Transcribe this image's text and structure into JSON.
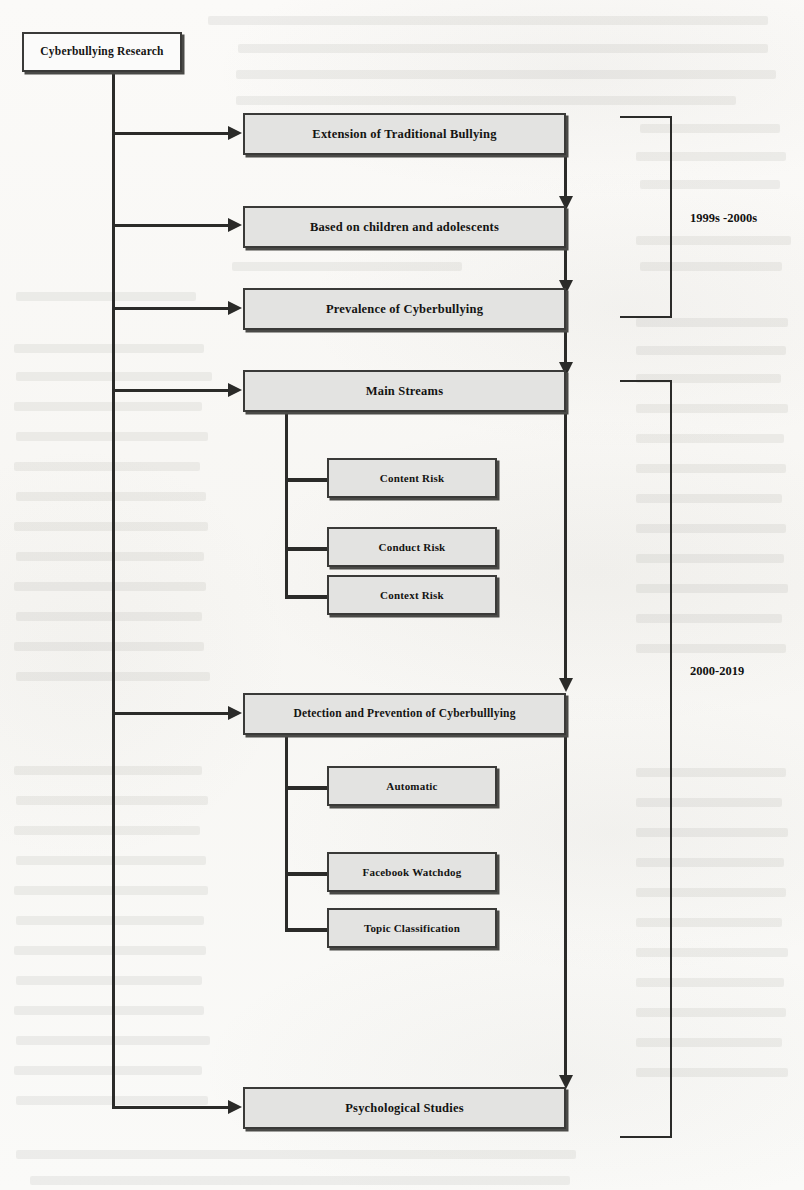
{
  "diagram": {
    "title_node": {
      "label": "Cyberbullying Research"
    },
    "nodes": [
      {
        "id": "extension",
        "label": "Extension of Traditional Bullying"
      },
      {
        "id": "based",
        "label": "Based on children and adolescents"
      },
      {
        "id": "prevalence",
        "label": "Prevalence of Cyberbullying"
      },
      {
        "id": "mainstreams",
        "label": "Main Streams"
      },
      {
        "id": "content",
        "label": "Content Risk"
      },
      {
        "id": "conduct",
        "label": "Conduct Risk"
      },
      {
        "id": "context",
        "label": "Context Risk"
      },
      {
        "id": "detection",
        "label": "Detection and Prevention of Cyberbulllying"
      },
      {
        "id": "automatic",
        "label": "Automatic"
      },
      {
        "id": "facebook",
        "label": "Facebook Watchdog"
      },
      {
        "id": "topic",
        "label": "Topic Classification"
      },
      {
        "id": "psych",
        "label": "Psychological Studies"
      }
    ],
    "era_brackets": [
      {
        "id": "era-early",
        "label": "1999s -2000s",
        "covers": [
          "extension",
          "based",
          "prevalence"
        ]
      },
      {
        "id": "era-late",
        "label": "2000-2019",
        "covers": [
          "mainstreams",
          "detection",
          "psych"
        ]
      }
    ],
    "colors": {
      "node_fill": "#e3e3e1",
      "root_fill": "#fbfbfa",
      "border": "#3a3a38",
      "connector": "#2b2b29",
      "text": "#141412",
      "page_background": "#faf9f7"
    }
  }
}
